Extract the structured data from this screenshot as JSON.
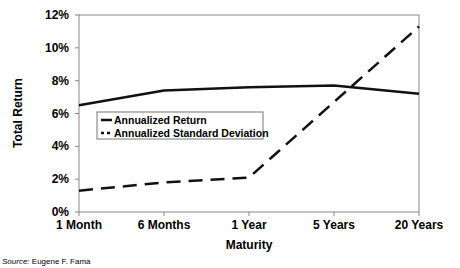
{
  "chart_data": {
    "type": "line",
    "title": "",
    "xlabel": "Maturity",
    "ylabel": "Total Return",
    "categories": [
      "1 Month",
      "6 Months",
      "1 Year",
      "5 Years",
      "20 Years"
    ],
    "series": [
      {
        "name": "Annualized Return",
        "style": "solid",
        "values": [
          6.5,
          7.4,
          7.6,
          7.7,
          7.2
        ]
      },
      {
        "name": "Annualized Standard Deviation",
        "style": "dashed",
        "values": [
          1.3,
          1.8,
          2.1,
          6.7,
          11.3
        ]
      }
    ],
    "ylim": [
      0,
      12
    ],
    "yticks": [
      "0%",
      "2%",
      "4%",
      "6%",
      "8%",
      "10%",
      "12%"
    ],
    "legend_position": "inside-left-middle",
    "grid": false
  },
  "legend": {
    "items": [
      "Annualized  Return",
      "Annualized  Standard  Deviation"
    ]
  },
  "source": {
    "label": "Source:",
    "text": " Eugene F. Fama"
  }
}
